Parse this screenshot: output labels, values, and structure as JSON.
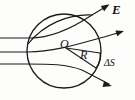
{
  "figure": {
    "type": "physics-diagram",
    "width": 135,
    "height": 100,
    "background_color": "#fdfdfc",
    "ink_color": "#1b1b1b"
  },
  "labels": {
    "field_label": "E",
    "center_label": "O",
    "radius_label": "R",
    "area_element_label": "ΔS"
  },
  "geometry": {
    "sphere": {
      "name": "gaussian-surface",
      "center_x": 64,
      "center_y": 51,
      "radius_x": 37,
      "radius_y": 37,
      "description": "Spherical Gaussian surface of radius R centred at O"
    },
    "radius_segment": {
      "from_x": 66,
      "from_y": 47,
      "to_x": 96,
      "to_y": 68,
      "label": "R"
    },
    "area_patch": {
      "description": "Small curved surface element on the right of the sphere",
      "label": "ΔS"
    },
    "field_lines": [
      {
        "name": "field-line-top",
        "entry_x": 0,
        "entry_y": 38,
        "exit_x": 110,
        "exit_y": 8,
        "has_arrowhead": true,
        "arrow_label": "E"
      },
      {
        "name": "field-line-middle",
        "entry_x": 0,
        "entry_y": 52,
        "exit_x": 124,
        "exit_y": 32,
        "has_arrowhead": true,
        "arrow_label": ""
      },
      {
        "name": "field-line-bottom",
        "entry_x": 0,
        "entry_y": 64,
        "exit_x": 112,
        "exit_y": 87,
        "has_arrowhead": true,
        "arrow_label": ""
      }
    ]
  }
}
